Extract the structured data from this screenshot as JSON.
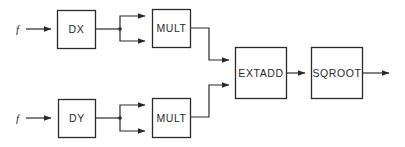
{
  "diagram": {
    "type": "block-diagram",
    "inputs": [
      {
        "id": "in-top",
        "label": "f"
      },
      {
        "id": "in-bottom",
        "label": "f"
      }
    ],
    "blocks": [
      {
        "id": "dx",
        "label": "DX"
      },
      {
        "id": "dy",
        "label": "DY"
      },
      {
        "id": "mult-top",
        "label": "MULT"
      },
      {
        "id": "mult-bottom",
        "label": "MULT"
      },
      {
        "id": "extadd",
        "label": "EXTADD"
      },
      {
        "id": "sqroot",
        "label": "SQROOT"
      }
    ],
    "edges": [
      {
        "from": "in-top",
        "to": "dx"
      },
      {
        "from": "dx",
        "to": "mult-top",
        "note": "split into two inputs"
      },
      {
        "from": "in-bottom",
        "to": "dy"
      },
      {
        "from": "dy",
        "to": "mult-bottom",
        "note": "split into two inputs"
      },
      {
        "from": "mult-top",
        "to": "extadd"
      },
      {
        "from": "mult-bottom",
        "to": "extadd"
      },
      {
        "from": "extadd",
        "to": "sqroot"
      },
      {
        "from": "sqroot",
        "to": "output"
      }
    ],
    "colors": {
      "stroke": "#2a2a2a",
      "background": "#ffffff"
    }
  }
}
